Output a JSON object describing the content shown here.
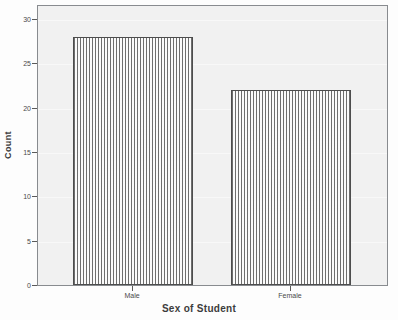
{
  "chart_data": {
    "type": "bar",
    "title": "",
    "subtitle": "",
    "categories": [
      "Male",
      "Female"
    ],
    "values": [
      28,
      22
    ],
    "xlabel": "Sex of Student",
    "ylabel": "Count",
    "ylim": [
      0,
      30
    ],
    "y_ticks": [
      0,
      5,
      10,
      15,
      20,
      25,
      30
    ],
    "y_tick_labels": [
      "0",
      "5",
      "10",
      "15",
      "20",
      "25",
      "30"
    ],
    "grid": false,
    "legend": null,
    "legend_position": "none",
    "series": [
      {
        "name": "Count",
        "values": [
          28,
          22
        ]
      }
    ],
    "annotations": []
  },
  "axes": {
    "y_title": "Count",
    "x_title": "Sex of Student",
    "y_tick_labels": [
      "30",
      "25",
      "20",
      "15",
      "10",
      "5",
      "0"
    ],
    "x_tick_labels": [
      "Male",
      "Female"
    ]
  },
  "bars": [
    {
      "label": "Male",
      "value": 28,
      "value_text": "28"
    },
    {
      "label": "Female",
      "value": 22,
      "value_text": "22"
    }
  ],
  "colors": {
    "plot_background": "#f1f1f1",
    "page_background": "#fdfdfd",
    "frame_border": "#888b8f",
    "bar_outline": "#4d4d4d",
    "bar_fill": "#fafafa",
    "bar_pattern": "#6e6e6e",
    "text": "#3c3c3c",
    "tick_text": "#4a4a4a"
  }
}
